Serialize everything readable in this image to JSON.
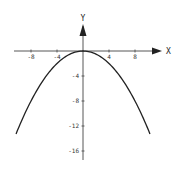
{
  "chart_data": {
    "type": "line",
    "title": "",
    "xlabel": "X",
    "ylabel": "Y",
    "function": "y = -x^2/8",
    "xlim": [
      -11,
      11
    ],
    "ylim": [
      -19,
      5
    ],
    "xticks": [
      -8,
      -4,
      4,
      8
    ],
    "xtick_labels": [
      "-8",
      "-4",
      "4",
      "8"
    ],
    "yticks": [
      -4,
      -8,
      -12,
      -16
    ],
    "ytick_labels": [
      "-4",
      "-8",
      "-12",
      "-16"
    ],
    "grid": false,
    "legend": null,
    "series": [
      {
        "name": "parabola",
        "x": [
          -10.3,
          -8,
          -6,
          -4,
          -2,
          0,
          2,
          4,
          6,
          8,
          10.3
        ],
        "y": [
          -13.3,
          -8,
          -4.5,
          -2,
          -0.5,
          0,
          -0.5,
          -2,
          -4.5,
          -8,
          -13.3
        ],
        "color": "#222222"
      }
    ]
  },
  "axes": {
    "x_label": "X",
    "y_label": "Y"
  }
}
